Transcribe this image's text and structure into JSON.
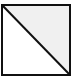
{
  "diagram": {
    "shape": "square-split-diagonal",
    "square": {
      "x": 2,
      "y": 5,
      "width": 68,
      "height": 70
    },
    "diagonal": "top-left-to-bottom-right",
    "colors": {
      "stroke": "#111111",
      "upper_right_fill": "#f0f0f0",
      "lower_left_fill": "#ffffff"
    }
  }
}
